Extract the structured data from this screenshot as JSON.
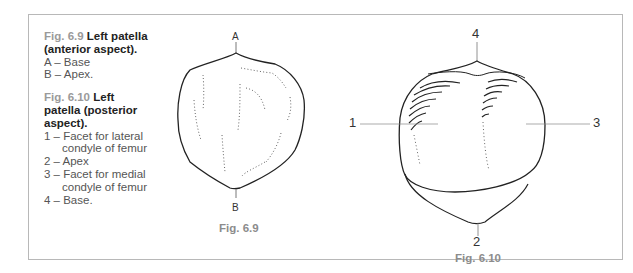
{
  "captions": {
    "fig69": {
      "number": "Fig. 6.9",
      "title": "Left patella (anterior aspect).",
      "items": [
        "A – Base",
        "B – Apex."
      ]
    },
    "fig610": {
      "number": "Fig. 6.10",
      "title_line1": "Left",
      "title_line2": "patella (posterior",
      "title_line3": "aspect).",
      "items": [
        "1 – Facet for lateral",
        "condyle of femur",
        "2 – Apex",
        "3 – Facet for medial",
        "condyle of femur",
        "4 – Base."
      ]
    }
  },
  "figures": {
    "fig69": {
      "label": "Fig. 6.9",
      "marker_top": "A",
      "marker_bottom": "B"
    },
    "fig610": {
      "label": "Fig. 6.10",
      "marker_top": "4",
      "marker_left": "1",
      "marker_right": "3",
      "marker_bottom": "2"
    }
  }
}
